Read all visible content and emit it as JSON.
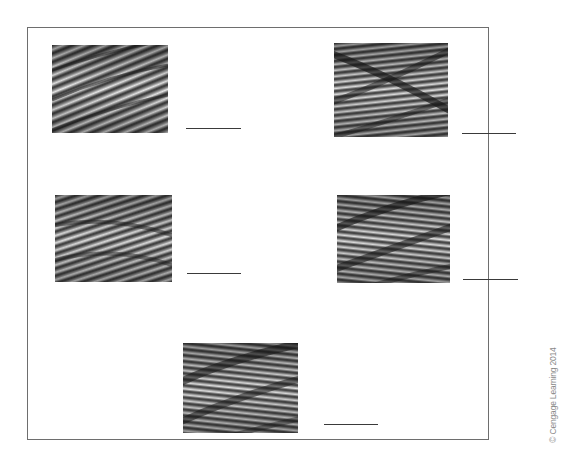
{
  "figure": {
    "copyright": "© Cengage Learning 2014",
    "items": [
      {
        "id": 1,
        "type": "wire-rope-photo",
        "lay": "lang-lay-right",
        "answer": ""
      },
      {
        "id": 2,
        "type": "wire-rope-photo",
        "lay": "regular-lay-right",
        "answer": ""
      },
      {
        "id": 3,
        "type": "wire-rope-photo",
        "lay": "lang-lay-right",
        "answer": ""
      },
      {
        "id": 4,
        "type": "wire-rope-photo",
        "lay": "regular-lay-left",
        "answer": ""
      },
      {
        "id": 5,
        "type": "wire-rope-photo",
        "lay": "regular-lay-left",
        "answer": ""
      }
    ]
  },
  "colors": {
    "frame": "#6e6e6e",
    "line": "#3a3a3a",
    "rope_dark": "#2e2e2e",
    "rope_light": "#e6e6e6"
  }
}
